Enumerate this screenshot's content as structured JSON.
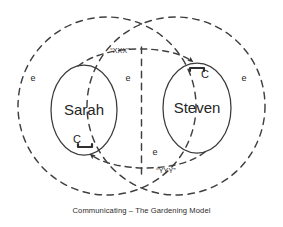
{
  "diagram": {
    "caption": "Communicating – The Gardening Model",
    "type": "venn-communication-diagram",
    "colors": {
      "stroke": "#3a3a3a",
      "dashed_stroke": "#3f3f3f",
      "text": "#262626",
      "background": "#ffffff"
    },
    "people": [
      {
        "id": "sarah",
        "label": "Sarah",
        "c_marker": "C",
        "c_position": "below"
      },
      {
        "id": "steven",
        "label": "Steven",
        "c_marker": "C",
        "c_position": "above"
      }
    ],
    "environment_markers": [
      {
        "id": "e-left",
        "label": "e"
      },
      {
        "id": "e-center-top",
        "label": "e"
      },
      {
        "id": "e-right",
        "label": "e"
      },
      {
        "id": "e-center-bottom",
        "label": "e"
      }
    ],
    "messages": [
      {
        "id": "message-xxx",
        "label": "“XXX”",
        "from": "sarah",
        "to": "steven"
      },
      {
        "id": "message-yyy",
        "label": "“YYY”",
        "from": "steven",
        "to": "sarah"
      }
    ]
  }
}
